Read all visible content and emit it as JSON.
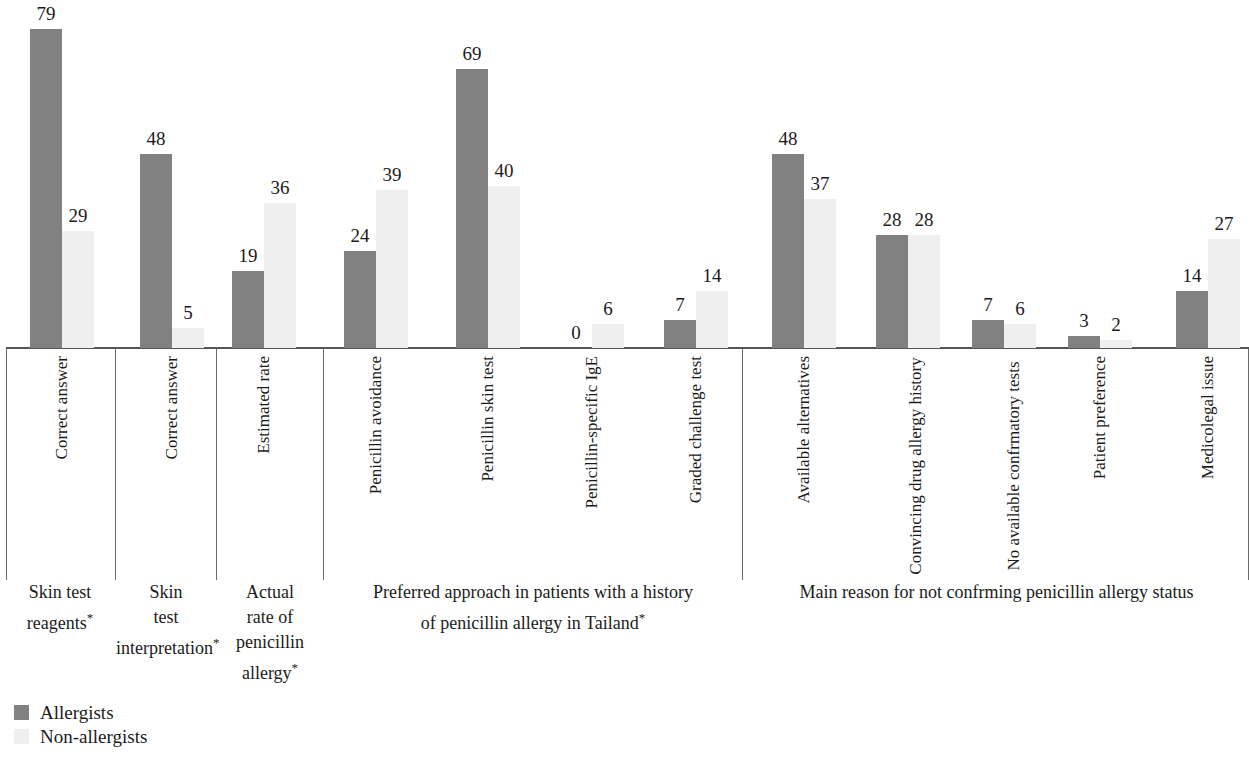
{
  "chart_data": {
    "type": "bar",
    "title": "",
    "subtitle": "",
    "xlabel": "",
    "ylabel": "",
    "ylim": [
      0,
      79
    ],
    "grid": false,
    "legend_position": "bottom-left",
    "value_labels_shown": true,
    "categories": [
      "Correct answer",
      "Correct answer",
      "Estimated rate",
      "Penicillin avoidance",
      "Penicillin skin test",
      "Penicillin-specific IgE",
      "Graded challenge test",
      "Available alternatives",
      "Convincing drug allergy history",
      "No available confrmatory tests",
      "Patient preference",
      "Medicolegal issue"
    ],
    "series": [
      {
        "name": "Allergists",
        "color": "#818181",
        "values": [
          79,
          48,
          19,
          24,
          69,
          0,
          7,
          48,
          28,
          7,
          3,
          14
        ]
      },
      {
        "name": "Non-allergists",
        "color": "#efefef",
        "values": [
          29,
          5,
          36,
          39,
          40,
          6,
          14,
          37,
          28,
          6,
          2,
          27
        ]
      }
    ],
    "groups": [
      {
        "caption": "Skin test reagents*",
        "categories": [
          "Correct answer"
        ]
      },
      {
        "caption": "Skin test interpretation*",
        "categories": [
          "Correct answer"
        ]
      },
      {
        "caption": "Actual rate of penicillin allergy*",
        "categories": [
          "Estimated rate"
        ]
      },
      {
        "caption": "Preferred approach in patients with a history of penicillin allergy in Tailand*",
        "categories": [
          "Penicillin avoidance",
          "Penicillin skin test",
          "Penicillin-specific IgE",
          "Graded challenge test"
        ]
      },
      {
        "caption": "Main reason for not confrming penicillin allergy status",
        "categories": [
          "Available alternatives",
          "Convincing drug allergy history",
          "No available confrmatory tests",
          "Patient preference",
          "Medicolegal issue"
        ]
      }
    ]
  },
  "categories": [
    {
      "label": "Correct answer"
    },
    {
      "label": "Correct answer"
    },
    {
      "label": "Estimated rate"
    },
    {
      "label": "Penicillin avoidance"
    },
    {
      "label": "Penicillin skin test"
    },
    {
      "label": "Penicillin-specific IgE"
    },
    {
      "label": "Graded challenge test"
    },
    {
      "label": "Available alternatives"
    },
    {
      "label": "Convincing drug allergy history"
    },
    {
      "label": "No available confrmatory tests"
    },
    {
      "label": "Patient preference"
    },
    {
      "label": "Medicolegal issue"
    }
  ],
  "bar_values": {
    "allergists": [
      "79",
      "48",
      "19",
      "24",
      "69",
      "0",
      "7",
      "48",
      "28",
      "7",
      "3",
      "14"
    ],
    "non_allergists": [
      "29",
      "5",
      "36",
      "39",
      "40",
      "6",
      "14",
      "37",
      "28",
      "6",
      "2",
      "27"
    ]
  },
  "groups": [
    {
      "caption_line1": "Skin test",
      "caption_line2": "reagents",
      "star": "*"
    },
    {
      "caption_line1": "Skin",
      "caption_line2": "test",
      "caption_line3": "interpretation",
      "star": "*"
    },
    {
      "caption_line1": "Actual",
      "caption_line2": "rate of",
      "caption_line3": "penicillin",
      "caption_line4": "allergy",
      "star": "*"
    },
    {
      "caption_line1": "Preferred approach in patients with a history",
      "caption_line2": "of penicillin allergy in Tailand",
      "star": "*"
    },
    {
      "caption_line1": "Main reason for not confrming penicillin allergy status",
      "star": ""
    }
  ],
  "legend": {
    "items": [
      {
        "label": "Allergists",
        "color": "#818181"
      },
      {
        "label": "Non-allergists",
        "color": "#efefef"
      }
    ]
  }
}
